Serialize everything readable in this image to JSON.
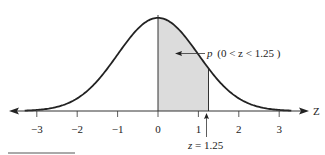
{
  "chart_data": {
    "type": "area",
    "title": "",
    "xlabel": "Z",
    "ylabel": "",
    "xlim": [
      -3.4,
      3.4
    ],
    "x_ticks": [
      -3,
      -2,
      -1,
      0,
      1,
      2,
      3
    ],
    "x_tick_labels": [
      "−3",
      "−2",
      "−1",
      "0",
      "1",
      "2",
      "3"
    ],
    "grid": false,
    "legend": null,
    "series": [
      {
        "name": "standard normal density",
        "type": "line",
        "function": "phi(z) = exp(-z^2/2)/sqrt(2*pi)",
        "x_range": [
          -3.3,
          3.3
        ]
      },
      {
        "name": "shaded area",
        "type": "area",
        "x_range": [
          0,
          1.25
        ],
        "fill": "#d9d9d9"
      }
    ],
    "annotations": [
      {
        "text_prefix": "p",
        "text": "(0 < z < 1.25 )",
        "points_to": "shaded area"
      },
      {
        "text": "z = 1.25",
        "points_to": "x = 1.25 on axis"
      }
    ]
  },
  "axis": {
    "label": "Z"
  },
  "ticks": [
    {
      "value": -3,
      "label": "−3"
    },
    {
      "value": -2,
      "label": "−2"
    },
    {
      "value": -1,
      "label": "−1"
    },
    {
      "value": 0,
      "label": "0"
    },
    {
      "value": 1,
      "label": "1"
    },
    {
      "value": 2,
      "label": "2"
    },
    {
      "value": 3,
      "label": "3"
    }
  ],
  "annotation": {
    "prob_prefix": "p",
    "prob_text": "(0 < z < 1.25 )",
    "z_marker_prefix": "z",
    "z_marker_text": " = 1.25"
  },
  "colors": {
    "curve": "#222222",
    "shade": "#dcdcdc",
    "axis": "#333333"
  }
}
